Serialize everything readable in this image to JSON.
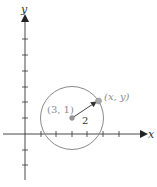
{
  "axes": {
    "x_label": "x",
    "y_label": "y",
    "origin_px": [
      25,
      134
    ],
    "unit_px": 15.6,
    "x_ticks": [
      1,
      2,
      3,
      4,
      5,
      6
    ],
    "y_ticks": [
      -2,
      -1,
      1,
      2,
      3,
      4,
      5,
      6
    ]
  },
  "circle": {
    "center_label": "(3, 1)",
    "center": [
      3,
      1
    ],
    "radius": 2,
    "radius_label": "2",
    "stroke_color": "#8a8a8a"
  },
  "point": {
    "label": "(x, y)",
    "color": "#9a9a9a"
  },
  "colors": {
    "axis": "#333333",
    "label_gray": "#8c8c8c",
    "text_dark": "#333333"
  }
}
